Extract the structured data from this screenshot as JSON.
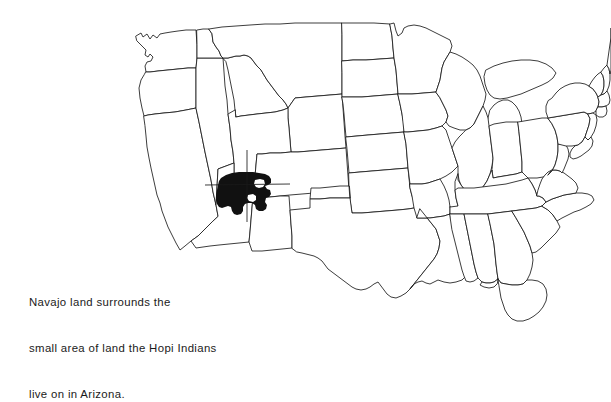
{
  "figure": {
    "name": "united-states-map-navajo-hopi",
    "background_color": "#ffffff",
    "outline_color": "#1a1a1a",
    "fill_color": "#ffffff",
    "highlight_color": "#111111",
    "width": 611,
    "height": 348
  },
  "caption": {
    "line1": "Navajo land surrounds the",
    "line2": "small area of land the Hopi Indians",
    "line3": "live on in Arizona.",
    "full_text": "Navajo land surrounds the small area of land the Hopi Indians live on in Arizona."
  },
  "map_data": {
    "type": "choropleth",
    "title": "",
    "projection": "outline map of the contiguous United States",
    "regions_highlighted": [
      {
        "name": "Navajo Nation",
        "color": "#111111",
        "states_spanned": [
          "Arizona",
          "Utah",
          "New Mexico"
        ],
        "description": "solid black area at the Four Corners region"
      },
      {
        "name": "Hopi Reservation",
        "color": "#ffffff",
        "states_spanned": [
          "Arizona"
        ],
        "description": "small white notch enclosed within the black Navajo area"
      }
    ],
    "four_corners_point": [
      247,
      185
    ],
    "legend": "none",
    "labels_shown": "none"
  }
}
